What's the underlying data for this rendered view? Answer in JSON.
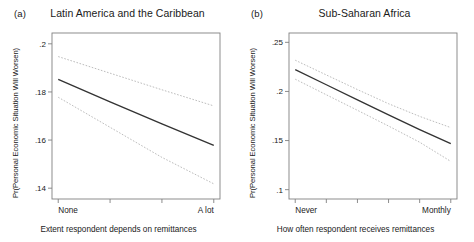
{
  "figure": {
    "width": 474,
    "height": 242,
    "background": "#ffffff",
    "line_color": "#333333",
    "ci_color": "#b0b0b0",
    "axis_color": "#808080"
  },
  "panels": [
    {
      "tag": "(a)",
      "title": "Latin America and the Caribbean",
      "ylabel": "Pr(Personal Economic Situation Will Worsen)",
      "xlabel": "Extent respondent depends on remittances"
    },
    {
      "tag": "(b)",
      "title": "Sub-Saharan Africa",
      "ylabel": "Pr(Personal Economic Situation Will Worsen)",
      "xlabel": "How often respondent receives remittances"
    }
  ],
  "chart_data": [
    {
      "type": "line",
      "panel": "(a)",
      "title": "Latin America and the Caribbean",
      "xlabel": "Extent respondent depends on remittances",
      "ylabel": "Pr(Personal Economic Situation Will Worsen)",
      "x": [
        0,
        1,
        2,
        3
      ],
      "xticklabels": [
        "None",
        "",
        "",
        "A lot"
      ],
      "xtick_values": [
        0,
        1,
        2,
        3
      ],
      "yticks": [
        0.14,
        0.16,
        0.18,
        0.2
      ],
      "yticklabels": [
        ".14",
        ".16",
        ".18",
        ".2"
      ],
      "ylim": [
        0.1355,
        0.2045
      ],
      "xlim": [
        -0.12,
        3.12
      ],
      "grid": false,
      "legend": "none",
      "series": [
        {
          "name": "Predicted probability",
          "style": "solid",
          "color": "#333333",
          "values": [
            0.1852,
            0.1759,
            0.1667,
            0.1578
          ]
        },
        {
          "name": "95% CI upper",
          "style": "dashed",
          "color": "#b0b0b0",
          "values": [
            0.1947,
            0.1878,
            0.1809,
            0.1742
          ]
        },
        {
          "name": "95% CI lower",
          "style": "dashed",
          "color": "#b0b0b0",
          "values": [
            0.1778,
            0.1653,
            0.1528,
            0.1418
          ]
        }
      ]
    },
    {
      "type": "line",
      "panel": "(b)",
      "title": "Sub-Saharan Africa",
      "xlabel": "How often respondent receives remittances",
      "ylabel": "Pr(Personal Economic Situation Will Worsen)",
      "x": [
        0,
        1,
        2,
        3,
        4,
        5
      ],
      "xticklabels": [
        "Never",
        "",
        "",
        "",
        "",
        "Monthly"
      ],
      "xtick_values": [
        0,
        1,
        2,
        3,
        4,
        5
      ],
      "yticks": [
        0.1,
        0.15,
        0.2,
        0.25
      ],
      "yticklabels": [
        ".1",
        ".15",
        ".2",
        ".25"
      ],
      "ylim": [
        0.0905,
        0.2595
      ],
      "xlim": [
        -0.2,
        5.2
      ],
      "grid": false,
      "legend": "none",
      "series": [
        {
          "name": "Predicted probability",
          "style": "solid",
          "color": "#333333",
          "values": [
            0.2222,
            0.2068,
            0.1915,
            0.1762,
            0.1611,
            0.1468
          ]
        },
        {
          "name": "95% CI upper",
          "style": "dashed",
          "color": "#b0b0b0",
          "values": [
            0.2318,
            0.2168,
            0.2019,
            0.1875,
            0.1746,
            0.1632
          ]
        },
        {
          "name": "95% CI lower",
          "style": "dashed",
          "color": "#b0b0b0",
          "values": [
            0.2125,
            0.1966,
            0.1808,
            0.1648,
            0.1483,
            0.1288
          ]
        }
      ]
    }
  ]
}
